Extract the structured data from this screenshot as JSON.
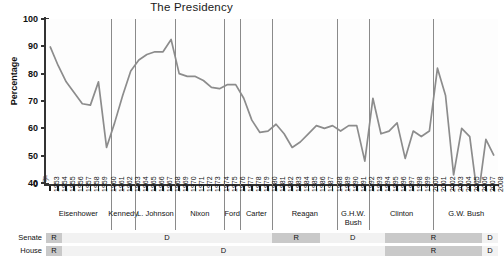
{
  "chart_data": {
    "type": "line",
    "title": "The Presidency",
    "xlabel": "",
    "ylabel": "Percentage",
    "ylim": [
      40,
      100
    ],
    "yticks": [
      40,
      50,
      60,
      70,
      80,
      90,
      100
    ],
    "y_axis_break": true,
    "y_zero_label": "0",
    "grid": false,
    "line_color": "#8c8c8c",
    "x": [
      1953,
      1954,
      1955,
      1956,
      1957,
      1958,
      1959,
      1960,
      1961,
      1962,
      1963,
      1964,
      1965,
      1966,
      1967,
      1968,
      1969,
      1970,
      1971,
      1972,
      1973,
      1974,
      1975,
      1976,
      1977,
      1978,
      1979,
      1980,
      1981,
      1982,
      1983,
      1984,
      1985,
      1986,
      1987,
      1988,
      1989,
      1990,
      1991,
      1992,
      1993,
      1994,
      1995,
      1996,
      1997,
      1998,
      1999,
      2000,
      2001,
      2002,
      2003,
      2004,
      2005,
      2006,
      2007,
      2008
    ],
    "values": [
      90,
      83,
      77,
      73,
      69,
      68.5,
      77,
      53,
      62,
      72,
      81,
      85,
      87,
      88,
      88,
      92.5,
      80,
      79,
      79,
      77.5,
      75,
      74.5,
      76,
      76,
      71,
      63,
      58.5,
      59,
      61.5,
      58,
      53,
      55,
      58,
      61,
      60,
      61,
      59,
      61,
      61,
      48,
      71,
      58,
      59,
      62,
      49,
      59,
      57,
      59,
      82,
      72,
      43,
      60,
      57,
      34,
      56,
      50
    ],
    "annotation_note": "Trend in percentage agreement/approval by year, 1953-2008"
  },
  "presidents": [
    {
      "name": "Eisenhower",
      "start": 1953,
      "end": 1960
    },
    {
      "name": "Kennedy",
      "start": 1961,
      "end": 1963
    },
    {
      "name": "L. Johnson",
      "start": 1964,
      "end": 1968
    },
    {
      "name": "Nixon",
      "start": 1969,
      "end": 1974
    },
    {
      "name": "Ford",
      "start": 1975,
      "end": 1976
    },
    {
      "name": "Carter",
      "start": 1977,
      "end": 1980
    },
    {
      "name": "Reagan",
      "start": 1981,
      "end": 1988
    },
    {
      "name": "G.H.W. Bush",
      "start": 1989,
      "end": 1992
    },
    {
      "name": "Clinton",
      "start": 1993,
      "end": 2000
    },
    {
      "name": "G.W. Bush",
      "start": 2001,
      "end": 2008
    }
  ],
  "control": {
    "senate_label": "Senate",
    "house_label": "House",
    "senate": [
      {
        "party": "R",
        "start": 1953,
        "end": 1954
      },
      {
        "party": "D",
        "start": 1955,
        "end": 1980
      },
      {
        "party": "R",
        "start": 1981,
        "end": 1986
      },
      {
        "party": "D",
        "start": 1987,
        "end": 1994
      },
      {
        "party": "R",
        "start": 1995,
        "end": 2006
      },
      {
        "party": "D",
        "start": 2007,
        "end": 2008
      }
    ],
    "house": [
      {
        "party": "R",
        "start": 1953,
        "end": 1954
      },
      {
        "party": "D",
        "start": 1955,
        "end": 1994
      },
      {
        "party": "R",
        "start": 1995,
        "end": 2006
      },
      {
        "party": "D",
        "start": 2007,
        "end": 2008
      }
    ]
  },
  "colors": {
    "line": "#8c8c8c",
    "block": "#c9c9c9",
    "track": "#f2f2f2",
    "separator": "#8a8a8a",
    "axis": "#333333",
    "band": "#ededed"
  }
}
